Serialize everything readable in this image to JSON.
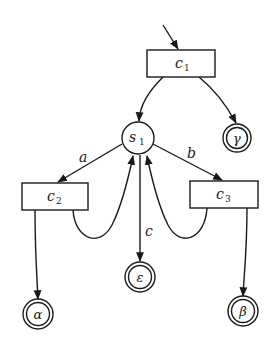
{
  "diagram": {
    "type": "state-transition-graph",
    "nodes": {
      "c1": {
        "label": "c",
        "sub": "1",
        "shape": "box"
      },
      "s1": {
        "label": "s",
        "sub": "1",
        "shape": "circle"
      },
      "c2": {
        "label": "c",
        "sub": "2",
        "shape": "box"
      },
      "c3": {
        "label": "c",
        "sub": "3",
        "shape": "box"
      },
      "gamma": {
        "label": "γ",
        "shape": "double-circle"
      },
      "alpha": {
        "label": "α",
        "shape": "double-circle"
      },
      "epsilon": {
        "label": "ε",
        "shape": "double-circle"
      },
      "beta": {
        "label": "β",
        "shape": "double-circle"
      }
    },
    "edges": [
      {
        "from": "start",
        "to": "c1",
        "label": ""
      },
      {
        "from": "c1",
        "to": "s1",
        "label": ""
      },
      {
        "from": "c1",
        "to": "gamma",
        "label": ""
      },
      {
        "from": "s1",
        "to": "c2",
        "label": "a"
      },
      {
        "from": "s1",
        "to": "c3",
        "label": "b"
      },
      {
        "from": "s1",
        "to": "epsilon",
        "label": "c"
      },
      {
        "from": "c2",
        "to": "s1",
        "label": ""
      },
      {
        "from": "c3",
        "to": "s1",
        "label": ""
      },
      {
        "from": "c2",
        "to": "alpha",
        "label": ""
      },
      {
        "from": "c3",
        "to": "beta",
        "label": ""
      }
    ],
    "edge_labels": {
      "a": "a",
      "b": "b",
      "c": "c"
    }
  }
}
